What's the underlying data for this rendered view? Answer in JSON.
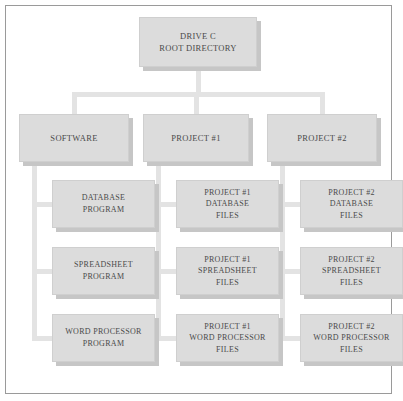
{
  "diagram": {
    "colors": {
      "box_fill": "#dcdcdc",
      "box_border": "#cfcfcf",
      "box_shadow": "#c6c6c6",
      "connector": "#e3e3e3",
      "frame_border": "#9a9a9a",
      "text": "#4a4a4a",
      "background": "#ffffff"
    },
    "root": {
      "name": "root-node",
      "lines": [
        "DRIVE C",
        "ROOT DIRECTORY"
      ]
    },
    "branches": [
      {
        "name": "software",
        "lines": [
          "SOFTWARE"
        ],
        "children": [
          {
            "name": "database-program",
            "lines": [
              "DATABASE",
              "PROGRAM"
            ]
          },
          {
            "name": "spreadsheet-program",
            "lines": [
              "SPREADSHEET",
              "PROGRAM"
            ]
          },
          {
            "name": "word-processor-program",
            "lines": [
              "WORD PROCESSOR",
              "PROGRAM"
            ]
          }
        ]
      },
      {
        "name": "project-1",
        "lines": [
          "PROJECT #1"
        ],
        "children": [
          {
            "name": "project-1-database-files",
            "lines": [
              "PROJECT #1",
              "DATABASE",
              "FILES"
            ]
          },
          {
            "name": "project-1-spreadsheet-files",
            "lines": [
              "PROJECT #1",
              "SPREADSHEET",
              "FILES"
            ]
          },
          {
            "name": "project-1-word-processor-files",
            "lines": [
              "PROJECT #1",
              "WORD PROCESSOR",
              "FILES"
            ]
          }
        ]
      },
      {
        "name": "project-2",
        "lines": [
          "PROJECT #2"
        ],
        "children": [
          {
            "name": "project-2-database-files",
            "lines": [
              "PROJECT #2",
              "DATABASE",
              "FILES"
            ]
          },
          {
            "name": "project-2-spreadsheet-files",
            "lines": [
              "PROJECT #2",
              "SPREADSHEET",
              "FILES"
            ]
          },
          {
            "name": "project-2-word-processor-files",
            "lines": [
              "PROJECT #2",
              "WORD PROCESSOR",
              "FILES"
            ]
          }
        ]
      }
    ]
  }
}
